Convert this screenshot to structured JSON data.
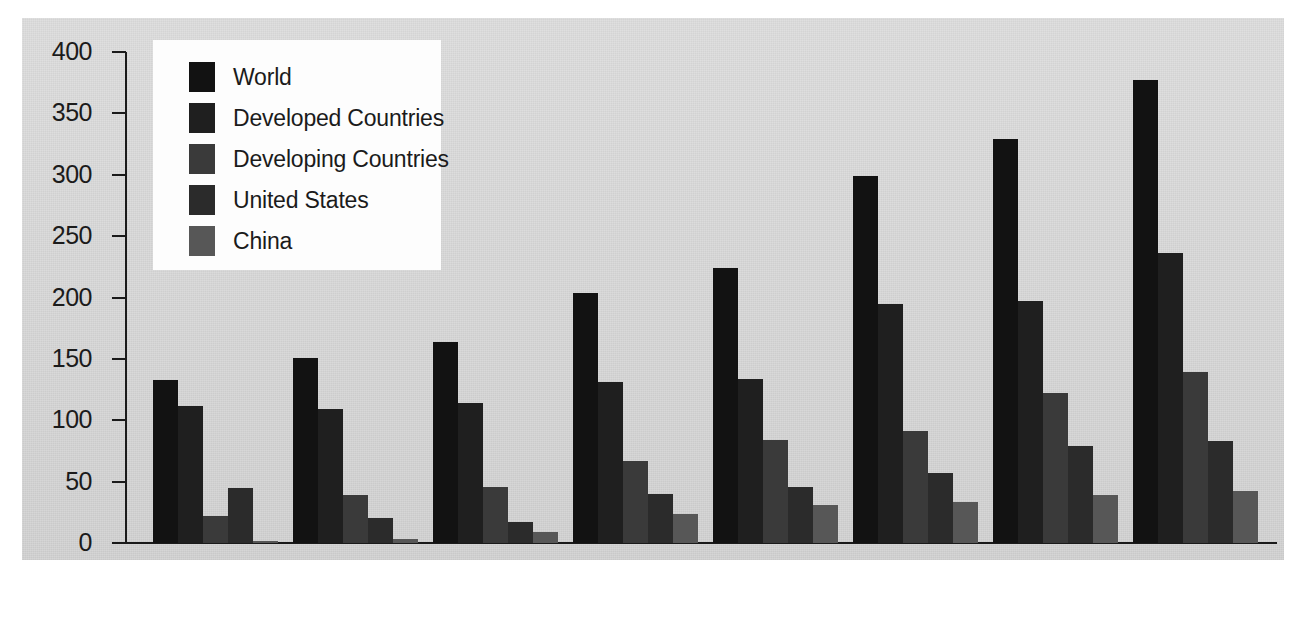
{
  "chart_data": {
    "type": "bar",
    "title": "",
    "subtitle": "",
    "xlabel": "",
    "ylabel": "",
    "ylim": [
      0,
      400
    ],
    "ytick_step": 50,
    "yticks": [
      "400",
      "350",
      "300",
      "250",
      "200",
      "150",
      "100",
      "50",
      "0"
    ],
    "grid": false,
    "legend_position": "top-left",
    "categories": [
      "1985-1990",
      "1991",
      "1992",
      "1993",
      "1994",
      "1995",
      "1996",
      "1997"
    ],
    "series": [
      {
        "name": "World",
        "color": "#121212",
        "values": [
          133,
          151,
          164,
          204,
          224,
          299,
          329,
          377
        ]
      },
      {
        "name": "Developed Countries",
        "color": "#1f1f1f",
        "values": [
          112,
          109,
          114,
          131,
          134,
          195,
          197,
          236
        ]
      },
      {
        "name": "Developing Countries",
        "color": "#3a3a3a",
        "values": [
          22,
          39,
          46,
          67,
          84,
          91,
          122,
          139
        ]
      },
      {
        "name": "United States",
        "color": "#2b2b2b",
        "values": [
          45,
          20,
          17,
          40,
          46,
          57,
          79,
          83
        ]
      },
      {
        "name": "China",
        "color": "#575757",
        "values": [
          2,
          3,
          9,
          24,
          31,
          33,
          39,
          42
        ]
      }
    ]
  },
  "legend": {
    "items": [
      {
        "label": "World"
      },
      {
        "label": "Developed Countries"
      },
      {
        "label": "Developing Countries"
      },
      {
        "label": "United States"
      },
      {
        "label": "China"
      }
    ]
  },
  "colors": {
    "page_background": "#ffffff",
    "plot_background": "#d6d6d6",
    "legend_background": "#fdfdfd",
    "axis": "#1a1a1a",
    "text": "#1b1b1b"
  }
}
